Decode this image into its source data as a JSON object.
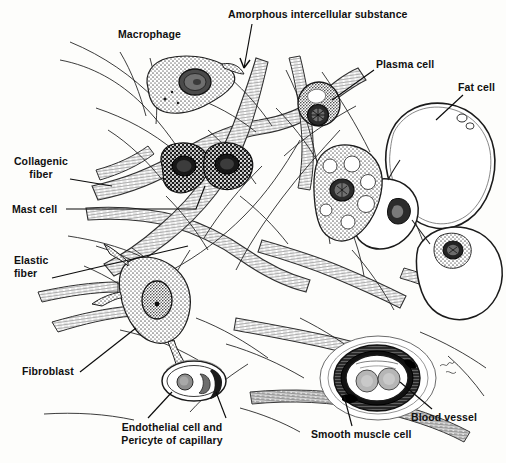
{
  "figure": {
    "background_color": "#fdfdfb",
    "ink_color": "#101010",
    "width": 506,
    "height": 463
  },
  "labels": [
    {
      "id": "amorphous-intercellular-substance",
      "text": "Amorphous intercellular substance",
      "x": 228,
      "y": 8,
      "align": "left",
      "leader": "arrow"
    },
    {
      "id": "macrophage",
      "text": "Macrophage",
      "x": 118,
      "y": 28,
      "align": "left",
      "leader": "none"
    },
    {
      "id": "plasma-cell",
      "text": "Plasma cell",
      "x": 376,
      "y": 58,
      "align": "left",
      "leader": "line"
    },
    {
      "id": "fat-cell",
      "text": "Fat cell",
      "x": 458,
      "y": 81,
      "align": "left",
      "leader": "line"
    },
    {
      "id": "collagenic-fiber",
      "text": "Collagenic\nfiber",
      "x": 18,
      "y": 155,
      "align": "center",
      "leader": "line"
    },
    {
      "id": "mast-cell",
      "text": "Mast cell",
      "x": 12,
      "y": 203,
      "align": "left",
      "leader": "line"
    },
    {
      "id": "elastic-fiber",
      "text": "Elastic\nfiber",
      "x": 14,
      "y": 254,
      "align": "left",
      "leader": "line"
    },
    {
      "id": "fibroblast",
      "text": "Fibroblast",
      "x": 22,
      "y": 365,
      "align": "left",
      "leader": "line"
    },
    {
      "id": "endothelial-cell-and-pericyte-of-capillary",
      "text": "Endothelial cell and Pericyte\nof capillary",
      "x": 104,
      "y": 421,
      "align": "center",
      "leader": "line"
    },
    {
      "id": "blood-vessel",
      "text": "Blood vessel",
      "x": 411,
      "y": 411,
      "align": "left",
      "leader": "line"
    },
    {
      "id": "smooth-muscle-cell",
      "text": "Smooth muscle cell",
      "x": 311,
      "y": 428,
      "align": "left",
      "leader": "line"
    }
  ],
  "structures": [
    {
      "id": "macrophage-cell",
      "name": "macrophage",
      "x": 178,
      "y": 85
    },
    {
      "id": "mast-cell-upper",
      "name": "mast cell",
      "x": 182,
      "y": 160
    },
    {
      "id": "mast-cell-lower",
      "name": "mast cell",
      "x": 213,
      "y": 172
    },
    {
      "id": "plasma-cell-body",
      "name": "plasma cell",
      "x": 319,
      "y": 105
    },
    {
      "id": "fat-cell-large",
      "name": "fat cell",
      "x": 438,
      "y": 158
    },
    {
      "id": "fat-cell-middle",
      "name": "fat cell",
      "x": 390,
      "y": 218
    },
    {
      "id": "fat-cell-lower",
      "name": "fat cell",
      "x": 458,
      "y": 232
    },
    {
      "id": "fibroblast-cell",
      "name": "fibroblast",
      "x": 164,
      "y": 300
    },
    {
      "id": "vacuolated-cell",
      "name": "vacuolated cell",
      "x": 344,
      "y": 190
    },
    {
      "id": "capillary",
      "name": "capillary",
      "x": 194,
      "y": 381
    },
    {
      "id": "blood-vessel-body",
      "name": "blood vessel",
      "x": 378,
      "y": 378
    },
    {
      "id": "collagenic-fiber-bundle",
      "name": "collagenic fiber bundle",
      "x": 250,
      "y": 230
    },
    {
      "id": "elastic-fiber-strand",
      "name": "elastic fiber strand",
      "x": 260,
      "y": 300
    }
  ]
}
